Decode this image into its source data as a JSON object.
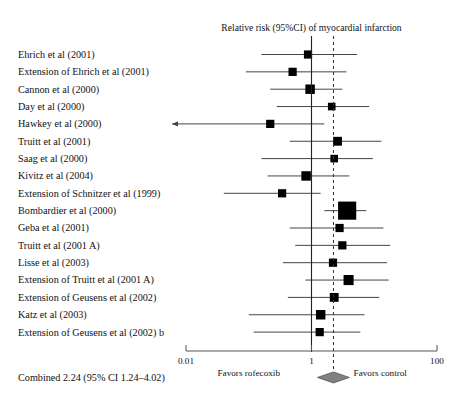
{
  "figure": {
    "title": "Relative risk (95%CI) of myocardial infarction",
    "combined_label": "Combined 2.24 (95% CI 1.24–4.02)",
    "favors_left": "Favors rofecoxib",
    "favors_right": "Favors control",
    "tick_labels": [
      "0.01",
      "1",
      "100"
    ],
    "null_line_value": "1",
    "pooled_line_value": "2.24",
    "marker_color": "#000000",
    "diamond_color": "#808080",
    "line_color": "#444444",
    "axis_color": "#555555"
  },
  "chart_data": {
    "type": "forest",
    "title": "Relative risk (95%CI) of myocardial infarction",
    "xlabel": "",
    "ylabel": "",
    "xscale": "log",
    "xlim": [
      0.01,
      100
    ],
    "xticks": [
      0.01,
      1,
      100
    ],
    "xticklabels": [
      "0.01",
      "1",
      "100"
    ],
    "grid": false,
    "reference_line": 1,
    "pooled_reference_line": 2.24,
    "legend": "none",
    "effect_measure": "Relative risk",
    "studies": [
      {
        "label": "Ehrich et al (2001)",
        "rr": 0.88,
        "low": 0.16,
        "high": 5.3,
        "weight": 6,
        "arrow_left": false
      },
      {
        "label": "Extension of Ehrich et al (2001)",
        "rr": 0.5,
        "low": 0.09,
        "high": 3.6,
        "weight": 6,
        "arrow_left": false
      },
      {
        "label": "Cannon et al (2000)",
        "rr": 0.95,
        "low": 0.22,
        "high": 3.1,
        "weight": 8,
        "arrow_left": false
      },
      {
        "label": "Day et al (2000)",
        "rr": 2.1,
        "low": 0.28,
        "high": 8.3,
        "weight": 5,
        "arrow_left": false
      },
      {
        "label": "Hawkey et al (2000)",
        "rr": 0.22,
        "low": 0.01,
        "high": 1.6,
        "weight": 6,
        "arrow_left": true
      },
      {
        "label": "Truitt et al (2001)",
        "rr": 2.6,
        "low": 0.45,
        "high": 13.0,
        "weight": 7,
        "arrow_left": false
      },
      {
        "label": "Saag et al (2000)",
        "rr": 2.3,
        "low": 0.16,
        "high": 9.5,
        "weight": 5,
        "arrow_left": false
      },
      {
        "label": "Kivitz et al (2004)",
        "rr": 0.82,
        "low": 0.2,
        "high": 4.0,
        "weight": 8,
        "arrow_left": false
      },
      {
        "label": "Extension of Schnitzer et al (1999)",
        "rr": 0.34,
        "low": 0.04,
        "high": 1.4,
        "weight": 6,
        "arrow_left": false
      },
      {
        "label": "Bombardier et al (2000)",
        "rr": 3.7,
        "low": 1.6,
        "high": 7.5,
        "weight": 22,
        "arrow_left": false
      },
      {
        "label": "Geba et al (2001)",
        "rr": 2.8,
        "low": 0.45,
        "high": 14.0,
        "weight": 6,
        "arrow_left": false
      },
      {
        "label": "Truitt et al (2001 A)",
        "rr": 3.1,
        "low": 0.55,
        "high": 18.0,
        "weight": 6,
        "arrow_left": false
      },
      {
        "label": "Lisse et al (2003)",
        "rr": 2.2,
        "low": 0.35,
        "high": 16.0,
        "weight": 6,
        "arrow_left": false
      },
      {
        "label": "Extension of Truitt et al (2001 A)",
        "rr": 3.9,
        "low": 0.8,
        "high": 17.0,
        "weight": 9,
        "arrow_left": false
      },
      {
        "label": "Extension of Geusens et al (2002)",
        "rr": 2.3,
        "low": 0.42,
        "high": 12.0,
        "weight": 7,
        "arrow_left": false
      },
      {
        "label": "Katz et al (2003)",
        "rr": 1.4,
        "low": 0.1,
        "high": 7.0,
        "weight": 8,
        "arrow_left": false
      },
      {
        "label": "Extension of Geusens et al (2002) b",
        "rr": 1.35,
        "low": 0.12,
        "high": 6.0,
        "weight": 6,
        "arrow_left": false
      }
    ],
    "combined": {
      "label": "Combined 2.24 (95% CI 1.24–4.02)",
      "rr": 2.24,
      "low": 1.24,
      "high": 4.02
    },
    "annotations": {
      "left": "Favors rofecoxib",
      "right": "Favors control"
    }
  }
}
